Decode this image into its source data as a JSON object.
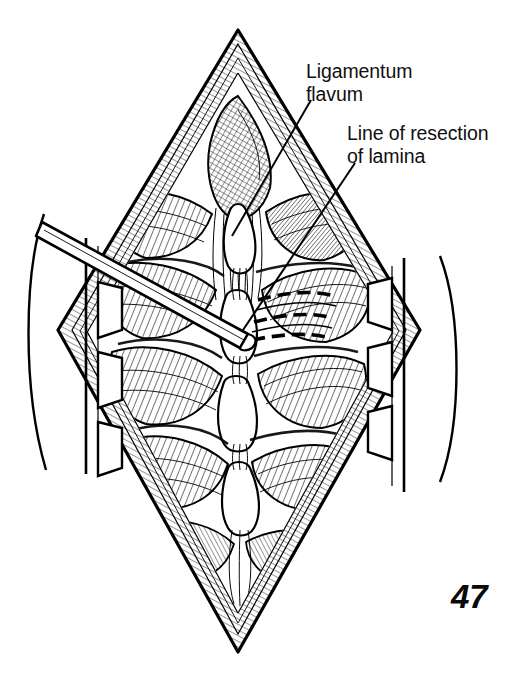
{
  "figure": {
    "number": "47",
    "type": "medical-illustration",
    "style": "black-and-white pen-and-ink line drawing with cross-hatching",
    "background_color": "#ffffff",
    "ink_color": "#000000"
  },
  "labels": [
    {
      "id": "ligamentum-flavum",
      "line1": "Ligamentum",
      "line2": "flavum",
      "text": "Ligamentum flavum",
      "x": 306,
      "y": 60,
      "leader_from": [
        311,
        100
      ],
      "leader_to": [
        232,
        236
      ]
    },
    {
      "id": "line-of-resection",
      "line1": "Line of resection",
      "line2": "of lamina",
      "text": "Line of resection of lamina",
      "x": 347,
      "y": 122,
      "leader_from": [
        355,
        163
      ],
      "leader_to": [
        243,
        330
      ]
    }
  ],
  "anatomy": {
    "wound": {
      "name": "midline-surgical-incision",
      "shape": "vertical-diamond",
      "apex_top": [
        238,
        30
      ],
      "apex_bottom": [
        238,
        652
      ],
      "left_extent": 58,
      "right_extent": 420
    },
    "structures": [
      "skin-and-fascia-edges",
      "paraspinal-muscle-cut-surface",
      "vertebral-laminae",
      "spinous-processes",
      "ligamentum-flavum",
      "interlaminar-space"
    ],
    "vertebral_levels": 4
  },
  "instruments": [
    {
      "name": "periosteal-elevator",
      "description": "thin straight probe entering from upper left",
      "tip": [
        244,
        330
      ],
      "tail": [
        42,
        222
      ]
    },
    {
      "name": "self-retaining-retractor-left",
      "side": "left",
      "teeth": 3
    },
    {
      "name": "self-retaining-retractor-right",
      "side": "right",
      "teeth": 3
    }
  ],
  "markings": {
    "resection_line": {
      "name": "dashed-resection-line",
      "style": "dashed",
      "segments": 3,
      "description": "dashed outline over right lamina indicating planned bone removal"
    }
  }
}
